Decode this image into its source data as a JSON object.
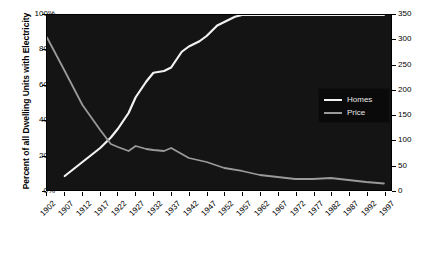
{
  "chart_data": {
    "type": "line",
    "title": "",
    "xlabel": "",
    "ylabel": "Percent of all Dwelling Units with Electricity",
    "ylabel_right": "Price (cents per kWh in 1998 dollars)",
    "background": "#141414",
    "grid": false,
    "legend_position": "center-right",
    "xlim": [
      1902,
      1999
    ],
    "ylim": [
      0,
      100
    ],
    "ylim_right": [
      0,
      350
    ],
    "xticks": [
      1902,
      1907,
      1912,
      1917,
      1922,
      1927,
      1932,
      1937,
      1942,
      1947,
      1952,
      1957,
      1962,
      1967,
      1972,
      1977,
      1982,
      1987,
      1992,
      1997
    ],
    "yticks_left": [
      "0%",
      "20%",
      "40%",
      "60%",
      "80%",
      "100%"
    ],
    "yticks_left_values": [
      0,
      20,
      40,
      60,
      80,
      100
    ],
    "yticks_right": [
      "0",
      "50",
      "100",
      "150",
      "200",
      "250",
      "300",
      "350"
    ],
    "yticks_right_values": [
      0,
      50,
      100,
      150,
      200,
      250,
      300,
      350
    ],
    "series": [
      {
        "name": "Homes",
        "color": "#f2f2f2",
        "axis": "left",
        "unit": "percent",
        "x": [
          1907,
          1912,
          1917,
          1920,
          1922,
          1925,
          1927,
          1930,
          1932,
          1935,
          1937,
          1940,
          1942,
          1945,
          1947,
          1950,
          1952,
          1955,
          1957,
          1960,
          1962,
          1967,
          1972,
          1977,
          1982,
          1987,
          1992,
          1997
        ],
        "values": [
          8,
          16,
          24,
          30,
          35,
          44,
          53,
          62,
          67,
          68,
          70,
          79,
          82,
          85,
          88,
          94,
          96,
          99,
          100,
          100,
          100,
          100,
          100,
          100,
          100,
          100,
          100,
          100
        ]
      },
      {
        "name": "Price",
        "color": "#9a9a9a",
        "axis": "right",
        "unit": "cents per kWh (1998 dollars)",
        "x": [
          1902,
          1907,
          1912,
          1917,
          1920,
          1922,
          1925,
          1927,
          1930,
          1932,
          1935,
          1937,
          1940,
          1942,
          1947,
          1952,
          1957,
          1962,
          1967,
          1972,
          1977,
          1982,
          1987,
          1992,
          1997
        ],
        "values": [
          305,
          238,
          170,
          120,
          92,
          86,
          78,
          88,
          82,
          80,
          78,
          84,
          72,
          64,
          56,
          44,
          38,
          30,
          26,
          22,
          22,
          24,
          20,
          16,
          13
        ]
      }
    ]
  },
  "legend": {
    "items": [
      {
        "label": "Homes",
        "color": "#f2f2f2"
      },
      {
        "label": "Price",
        "color": "#9a9a9a"
      }
    ]
  }
}
